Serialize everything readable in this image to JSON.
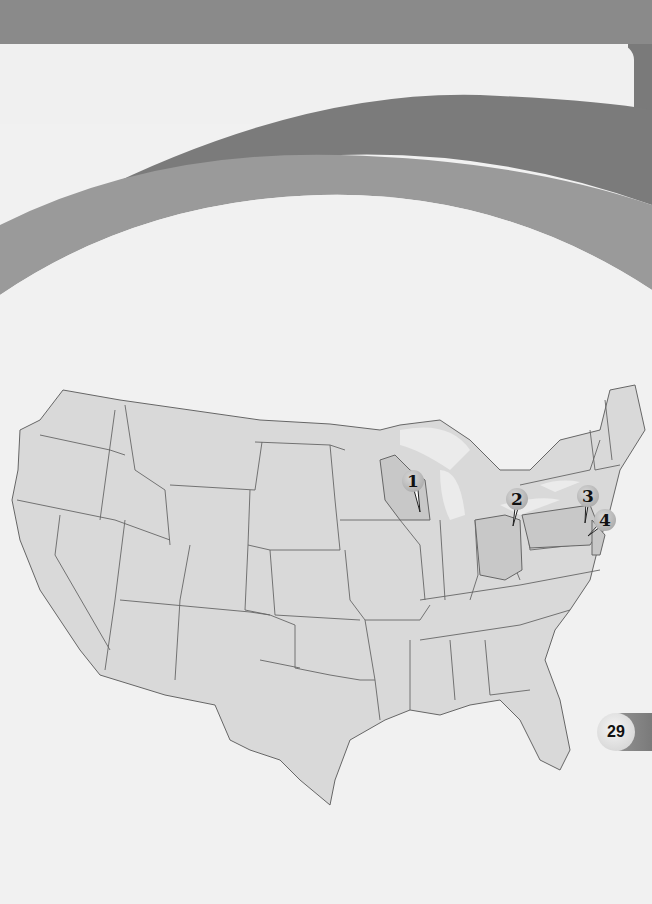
{
  "page": {
    "page_number": "29",
    "colors": {
      "header_band": "#8a8a8a",
      "swoosh_dark": "#7a7a7a",
      "swoosh_light": "#999999",
      "land": "#d9d9d9",
      "highlighted_state": "#c8c8c8",
      "borders": "#666666",
      "background": "#f1f1f1"
    }
  },
  "map": {
    "title": "United States",
    "markers": [
      {
        "label": "1",
        "state": "Wisconsin"
      },
      {
        "label": "2",
        "state": "Ohio"
      },
      {
        "label": "3",
        "state": "Pennsylvania"
      },
      {
        "label": "4",
        "state": "New Jersey"
      }
    ]
  }
}
